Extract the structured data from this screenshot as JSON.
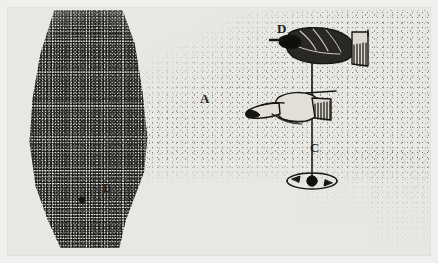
{
  "figure": {
    "kind": "engraved-plate-illustration",
    "background_color": "#e7e7e4",
    "ink_color": "#1d1b19",
    "border_color": "#efefed"
  },
  "labels": [
    {
      "id": "A",
      "text": "A",
      "meaning": "stippled field / cone of revolution region",
      "x": 205,
      "y": 99
    },
    {
      "id": "B",
      "text": "B",
      "meaning": "point within the dense stippled column",
      "x": 108,
      "y": 188
    },
    {
      "id": "C",
      "text": "C",
      "meaning": "revolving ball at lower end of the string",
      "x": 314,
      "y": 148
    },
    {
      "id": "D",
      "text": "D",
      "meaning": "upper hand grasping the string",
      "x": 282,
      "y": 29
    }
  ],
  "elements": {
    "upper_hand": {
      "name": "hand-holding-string",
      "cuff": "hatched shirt cuff at right",
      "x": 300,
      "y": 48
    },
    "lower_hand": {
      "name": "pointing-hand",
      "gesture": "index finger extended to the left",
      "cuff": "hatched shirt cuff at right",
      "x": 290,
      "y": 110
    },
    "string": {
      "name": "vertical-string",
      "top_y": 48,
      "bottom_y": 180,
      "x": 312
    },
    "ball": {
      "name": "pendulum-ball",
      "x": 312,
      "y": 181,
      "radius": 5
    },
    "orbit": {
      "name": "circular-orbit-path",
      "cx": 312,
      "cy": 181,
      "rx": 25,
      "ry": 8,
      "arrow_count": 2,
      "direction": "counter-clockwise"
    },
    "column": {
      "name": "dense-stipple-column",
      "x": 14,
      "y": 10,
      "width": 155,
      "height": 245
    },
    "field": {
      "name": "stipple-field-a",
      "x": 105,
      "y": 10,
      "width": 330,
      "height": 180
    },
    "point_b_dot": {
      "name": "point-b-marker",
      "x": 82,
      "y": 200
    }
  }
}
